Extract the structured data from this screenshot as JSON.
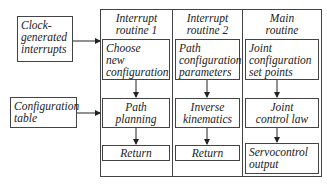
{
  "inputs": {
    "clock": "Clock-\ngenerated\ninterrupts",
    "config_table": "Configuration\ntable"
  },
  "columns": [
    {
      "header": "Interrupt\nroutine 1",
      "steps": [
        "Choose\nnew\nconfiguration",
        "Path\nplanning",
        "Return"
      ]
    },
    {
      "header": "Interrupt\nroutine 2",
      "steps": [
        "Path\nconfiguration\nparameters",
        "Inverse\nkinematics",
        "Return"
      ]
    },
    {
      "header": "Main\nroutine",
      "steps": [
        "Joint\nconfiguration\nset points",
        "Joint\ncontrol law",
        "Servocontrol\noutput"
      ]
    }
  ]
}
